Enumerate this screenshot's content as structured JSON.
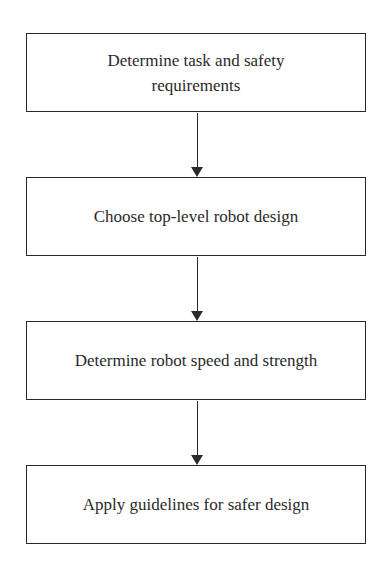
{
  "diagram": {
    "type": "flowchart",
    "direction": "top-to-bottom",
    "steps": [
      {
        "label": "Determine task and safety requirements",
        "line1": "Determine task and safety",
        "line2": "requirements"
      },
      {
        "label": "Choose top-level robot design"
      },
      {
        "label": "Determine robot speed and strength"
      },
      {
        "label": "Apply guidelines for safer design"
      }
    ],
    "edges": [
      {
        "from": 0,
        "to": 1
      },
      {
        "from": 1,
        "to": 2
      },
      {
        "from": 2,
        "to": 3
      }
    ]
  }
}
